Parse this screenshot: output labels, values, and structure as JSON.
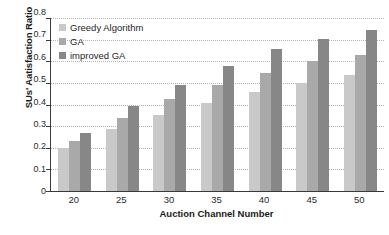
{
  "chart_data": {
    "type": "bar",
    "title": "",
    "xlabel": "Auction Channel Number",
    "ylabel": "SUs' Aatisfaction Ratio",
    "categories": [
      "20",
      "25",
      "30",
      "35",
      "40",
      "45",
      "50"
    ],
    "series": [
      {
        "name": "Greedy Algorithm",
        "color": "#c9c9c9",
        "values": [
          0.2,
          0.285,
          0.353,
          0.408,
          0.457,
          0.498,
          0.535
        ]
      },
      {
        "name": "GA",
        "color": "#a9a9a9",
        "values": [
          0.231,
          0.338,
          0.425,
          0.492,
          0.548,
          0.6,
          0.63
        ]
      },
      {
        "name": "improved GA",
        "color": "#878787",
        "values": [
          0.266,
          0.393,
          0.49,
          0.578,
          0.658,
          0.701,
          0.743
        ]
      }
    ],
    "ylim": [
      0,
      0.8
    ],
    "ytick_values": [
      0.8,
      0.7,
      0.6,
      0.5,
      0.4,
      0.3,
      0.2,
      0.1,
      0
    ],
    "ytick_labels": [
      "0.8",
      "0.7",
      "0.6",
      "0.5",
      "0.4",
      "0.3",
      "0.2",
      "0.1",
      "0"
    ],
    "grid": true,
    "grid_axis": "y",
    "grid_style": "dotted",
    "legend_position": "top-left",
    "legend_entries": [
      "Greedy Algorithm",
      "GA",
      "improved GA"
    ]
  }
}
